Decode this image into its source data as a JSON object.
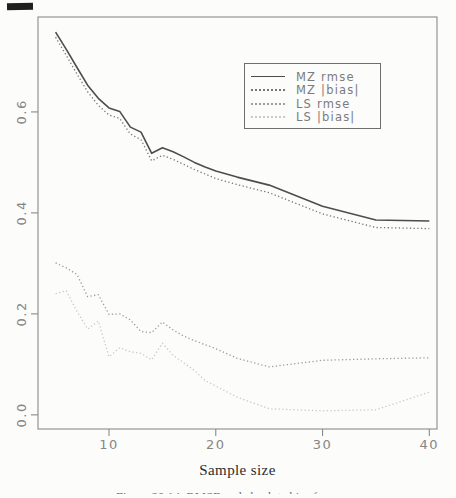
{
  "axes": {
    "x_label": "Sample size",
    "x_tick_labels": [
      "10",
      "20",
      "30",
      "40"
    ],
    "y_tick_labels": [
      "0.0",
      "0.2",
      "0.4",
      "0.6"
    ]
  },
  "caption": {
    "text": "Figure 20.14: RMSE and absolute bias for ..."
  },
  "colors": {
    "plot_border": "#8a8a8a",
    "tick_label": "#868686",
    "legend_border": "#6e6e6e",
    "background": "#fcfcfb"
  },
  "chart_data": {
    "type": "line",
    "title": "",
    "xlabel": "Sample size",
    "ylabel": "",
    "grid": false,
    "legend_position": "upper-center-right inset box",
    "xlim": [
      3.35,
      40.72
    ],
    "ylim": [
      -0.028,
      0.788
    ],
    "x_ticks": [
      10,
      20,
      30,
      40
    ],
    "y_ticks": [
      0.0,
      0.2,
      0.4,
      0.6
    ],
    "x": [
      5,
      6,
      7,
      8,
      9,
      10,
      11,
      12,
      13,
      14,
      15,
      16,
      17,
      18,
      19,
      20,
      22,
      25,
      30,
      35,
      40
    ],
    "series": [
      {
        "name": "MZ rmse",
        "style": "solid",
        "color": "#4d4d4d",
        "values": [
          0.758,
          0.724,
          0.688,
          0.653,
          0.627,
          0.608,
          0.601,
          0.57,
          0.56,
          0.518,
          0.529,
          0.521,
          0.511,
          0.5,
          0.491,
          0.483,
          0.471,
          0.455,
          0.413,
          0.386,
          0.384
        ]
      },
      {
        "name": "MZ |bias|",
        "style": "dotted",
        "color": "#767676",
        "values": [
          0.748,
          0.712,
          0.675,
          0.64,
          0.613,
          0.594,
          0.587,
          0.556,
          0.545,
          0.503,
          0.514,
          0.506,
          0.496,
          0.486,
          0.477,
          0.468,
          0.456,
          0.44,
          0.398,
          0.371,
          0.369
        ]
      },
      {
        "name": "LS rmse",
        "style": "dotted",
        "color": "#9c9c9c",
        "values": [
          0.301,
          0.291,
          0.278,
          0.234,
          0.238,
          0.199,
          0.2,
          0.188,
          0.165,
          0.163,
          0.184,
          0.168,
          0.156,
          0.147,
          0.139,
          0.131,
          0.112,
          0.095,
          0.108,
          0.111,
          0.113
        ]
      },
      {
        "name": "LS |bias|",
        "style": "dotted",
        "color": "#c9c9c9",
        "values": [
          0.24,
          0.246,
          0.205,
          0.17,
          0.186,
          0.115,
          0.133,
          0.125,
          0.122,
          0.109,
          0.142,
          0.118,
          0.103,
          0.088,
          0.068,
          0.057,
          0.035,
          0.012,
          0.008,
          0.01,
          0.045
        ]
      }
    ]
  }
}
